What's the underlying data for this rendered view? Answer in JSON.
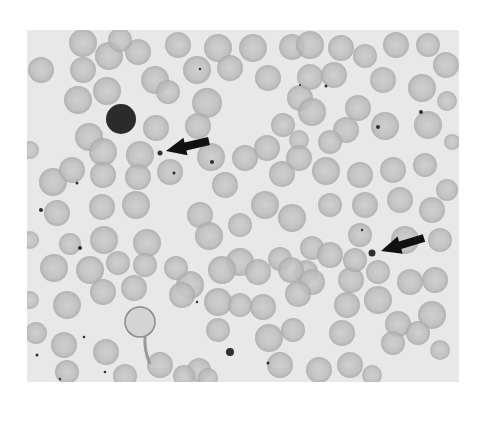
{
  "figure": {
    "panel": {
      "x": 27,
      "y": 30,
      "w": 432,
      "h": 352
    },
    "colors": {
      "page": "#ffffff",
      "background": "#e8e8e8",
      "rbc": "#bdbdbd",
      "rbc_center": "#cbcbcb",
      "rbc_edge": "#a9a9a9",
      "lymphocyte": "#2b2b2b",
      "dot": "#303030",
      "arrow": "#111111"
    },
    "lymphocyte": {
      "cx": 121,
      "cy": 119,
      "r": 15
    },
    "large_cell": {
      "cx": 140,
      "cy": 322,
      "r": 15
    },
    "arrows": [
      {
        "tip": [
          166,
          151
        ],
        "tail": [
          209,
          141
        ],
        "target_dot": [
          160,
          153
        ]
      },
      {
        "tip": [
          381,
          251
        ],
        "tail": [
          424,
          238
        ],
        "target_dot": [
          372,
          253
        ]
      }
    ],
    "dots": [
      [
        160,
        153,
        2.5
      ],
      [
        372,
        253,
        3.5
      ],
      [
        230,
        352,
        4
      ],
      [
        200,
        69,
        1.2
      ],
      [
        326,
        86,
        1.5
      ],
      [
        41,
        210,
        2
      ],
      [
        80,
        248,
        2
      ],
      [
        77,
        183,
        1.5
      ],
      [
        212,
        162,
        2
      ],
      [
        174,
        173,
        1.5
      ],
      [
        37,
        355,
        1.5
      ],
      [
        105,
        372,
        1.3
      ],
      [
        60,
        379,
        1.2
      ],
      [
        84,
        337,
        1.3
      ],
      [
        421,
        112,
        2
      ],
      [
        378,
        127,
        2
      ],
      [
        197,
        302,
        1.2
      ],
      [
        268,
        363,
        1.5
      ],
      [
        362,
        230,
        1.2
      ],
      [
        300,
        85,
        1
      ]
    ],
    "cells": [
      [
        41,
        70,
        13
      ],
      [
        83,
        43,
        14
      ],
      [
        83,
        70,
        13
      ],
      [
        109,
        56,
        14
      ],
      [
        138,
        52,
        13
      ],
      [
        120,
        40,
        12
      ],
      [
        78,
        100,
        14
      ],
      [
        107,
        91,
        14
      ],
      [
        155,
        80,
        14
      ],
      [
        89,
        137,
        14
      ],
      [
        156,
        128,
        13
      ],
      [
        178,
        45,
        13
      ],
      [
        197,
        70,
        14
      ],
      [
        218,
        48,
        14
      ],
      [
        230,
        68,
        13
      ],
      [
        207,
        103,
        15
      ],
      [
        253,
        48,
        14
      ],
      [
        268,
        78,
        13
      ],
      [
        292,
        47,
        13
      ],
      [
        300,
        98,
        13
      ],
      [
        283,
        125,
        12
      ],
      [
        299,
        140,
        10
      ],
      [
        198,
        126,
        13
      ],
      [
        168,
        92,
        12
      ],
      [
        310,
        45,
        14
      ],
      [
        341,
        48,
        13
      ],
      [
        365,
        56,
        12
      ],
      [
        396,
        45,
        13
      ],
      [
        428,
        45,
        12
      ],
      [
        446,
        65,
        13
      ],
      [
        310,
        77,
        13
      ],
      [
        334,
        75,
        13
      ],
      [
        383,
        80,
        13
      ],
      [
        422,
        88,
        14
      ],
      [
        447,
        101,
        10
      ],
      [
        312,
        112,
        14
      ],
      [
        358,
        108,
        13
      ],
      [
        346,
        130,
        13
      ],
      [
        385,
        126,
        14
      ],
      [
        428,
        125,
        14
      ],
      [
        452,
        142,
        8
      ],
      [
        330,
        142,
        12
      ],
      [
        53,
        182,
        14
      ],
      [
        72,
        170,
        13
      ],
      [
        103,
        152,
        14
      ],
      [
        103,
        175,
        13
      ],
      [
        140,
        155,
        14
      ],
      [
        138,
        177,
        13
      ],
      [
        170,
        172,
        13
      ],
      [
        102,
        207,
        13
      ],
      [
        57,
        213,
        13
      ],
      [
        70,
        244,
        11
      ],
      [
        136,
        205,
        14
      ],
      [
        104,
        240,
        14
      ],
      [
        147,
        243,
        14
      ],
      [
        211,
        157,
        14
      ],
      [
        245,
        158,
        13
      ],
      [
        267,
        148,
        13
      ],
      [
        225,
        185,
        13
      ],
      [
        282,
        174,
        13
      ],
      [
        299,
        158,
        13
      ],
      [
        326,
        171,
        14
      ],
      [
        200,
        215,
        13
      ],
      [
        209,
        236,
        14
      ],
      [
        265,
        205,
        14
      ],
      [
        240,
        225,
        12
      ],
      [
        292,
        218,
        14
      ],
      [
        330,
        205,
        12
      ],
      [
        240,
        262,
        14
      ],
      [
        280,
        259,
        12
      ],
      [
        312,
        248,
        12
      ],
      [
        330,
        255,
        13
      ],
      [
        306,
        272,
        12
      ],
      [
        360,
        175,
        13
      ],
      [
        393,
        170,
        13
      ],
      [
        425,
        165,
        12
      ],
      [
        447,
        190,
        11
      ],
      [
        365,
        205,
        13
      ],
      [
        400,
        200,
        13
      ],
      [
        432,
        210,
        13
      ],
      [
        360,
        235,
        12
      ],
      [
        405,
        240,
        14
      ],
      [
        440,
        240,
        12
      ],
      [
        222,
        270,
        14
      ],
      [
        190,
        285,
        14
      ],
      [
        218,
        302,
        14
      ],
      [
        240,
        305,
        12
      ],
      [
        258,
        272,
        13
      ],
      [
        291,
        270,
        13
      ],
      [
        312,
        282,
        13
      ],
      [
        351,
        280,
        13
      ],
      [
        355,
        260,
        12
      ],
      [
        378,
        272,
        12
      ],
      [
        410,
        282,
        13
      ],
      [
        435,
        280,
        13
      ],
      [
        378,
        300,
        14
      ],
      [
        263,
        307,
        13
      ],
      [
        298,
        294,
        13
      ],
      [
        347,
        305,
        13
      ],
      [
        398,
        324,
        13
      ],
      [
        432,
        315,
        14
      ],
      [
        218,
        330,
        12
      ],
      [
        269,
        338,
        14
      ],
      [
        293,
        330,
        12
      ],
      [
        342,
        333,
        13
      ],
      [
        393,
        343,
        12
      ],
      [
        418,
        333,
        12
      ],
      [
        440,
        350,
        10
      ],
      [
        199,
        370,
        12
      ],
      [
        280,
        365,
        13
      ],
      [
        319,
        370,
        13
      ],
      [
        350,
        365,
        13
      ],
      [
        372,
        375,
        10
      ],
      [
        208,
        378,
        10
      ],
      [
        54,
        268,
        14
      ],
      [
        90,
        270,
        14
      ],
      [
        118,
        263,
        12
      ],
      [
        103,
        292,
        13
      ],
      [
        134,
        288,
        13
      ],
      [
        145,
        265,
        12
      ],
      [
        176,
        268,
        12
      ],
      [
        182,
        295,
        13
      ],
      [
        67,
        305,
        14
      ],
      [
        36,
        333,
        11
      ],
      [
        64,
        345,
        13
      ],
      [
        106,
        352,
        13
      ],
      [
        67,
        372,
        12
      ],
      [
        125,
        376,
        12
      ],
      [
        160,
        365,
        13
      ],
      [
        184,
        376,
        11
      ],
      [
        30,
        300,
        9
      ],
      [
        30,
        240,
        9
      ],
      [
        30,
        150,
        9
      ]
    ]
  }
}
